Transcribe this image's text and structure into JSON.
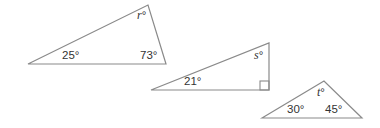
{
  "figure": {
    "triangles": [
      {
        "id": "triangle-r",
        "angles": [
          {
            "label": "25",
            "unit": "°"
          },
          {
            "label": "73",
            "unit": "°"
          },
          {
            "label": "r",
            "unit": "°",
            "unknown": true
          }
        ]
      },
      {
        "id": "triangle-s",
        "angles": [
          {
            "label": "21",
            "unit": "°"
          },
          {
            "label": "s",
            "unit": "°",
            "unknown": true
          },
          {
            "label": "right-angle",
            "marker": "square"
          }
        ]
      },
      {
        "id": "triangle-t",
        "angles": [
          {
            "label": "30",
            "unit": "°"
          },
          {
            "label": "45",
            "unit": "°"
          },
          {
            "label": "t",
            "unit": "°",
            "unknown": true
          }
        ]
      }
    ],
    "colors": {
      "stroke": "#8a8a8a",
      "text": "#333333"
    }
  }
}
